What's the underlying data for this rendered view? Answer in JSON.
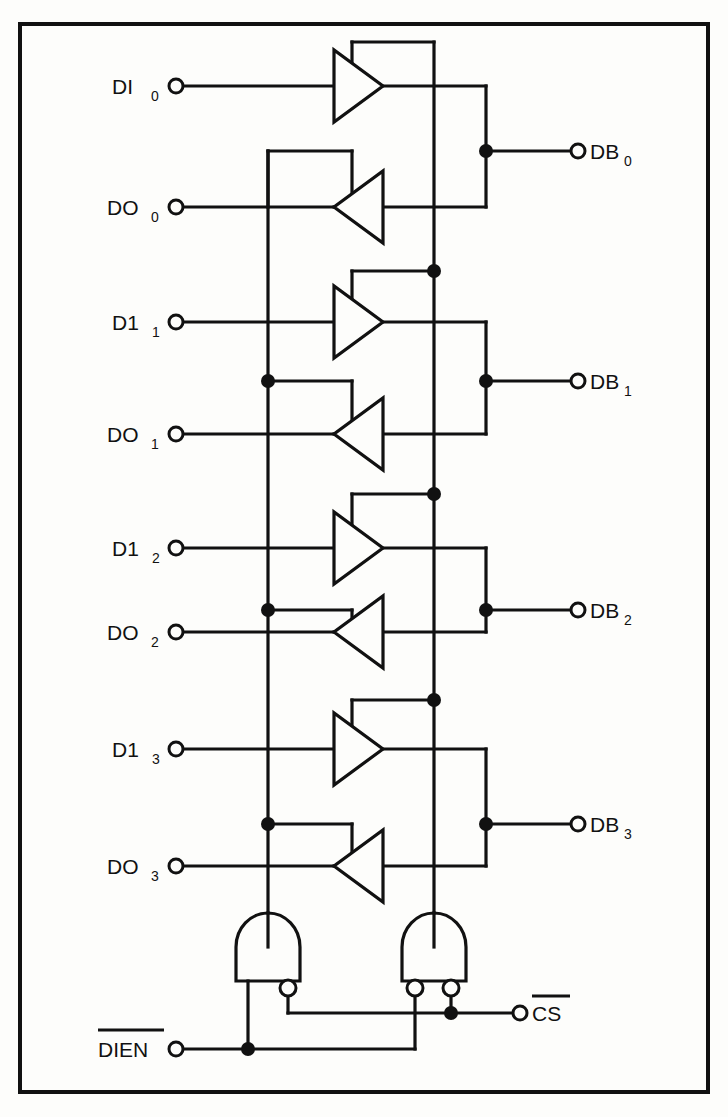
{
  "figure": {
    "kind": "logic-schematic",
    "background": "#fdfdfb",
    "ink": "#111111",
    "frame": {
      "x": 18,
      "y": 22,
      "width": 692,
      "height": 1072,
      "stroke_width": 4
    }
  },
  "channels": [
    {
      "index": 0,
      "in_label": "DI",
      "in_sub": "0",
      "out_label": "DO",
      "out_sub": "0",
      "bus_label": "DB",
      "bus_sub": "0"
    },
    {
      "index": 1,
      "in_label": "D1",
      "in_sub": "1",
      "out_label": "DO",
      "out_sub": "1",
      "bus_label": "DB",
      "bus_sub": "1"
    },
    {
      "index": 2,
      "in_label": "D1",
      "in_sub": "2",
      "out_label": "DO",
      "out_sub": "2",
      "bus_label": "DB",
      "bus_sub": "2"
    },
    {
      "index": 3,
      "in_label": "D1",
      "in_sub": "3",
      "out_label": "DO",
      "out_sub": "3",
      "bus_label": "DB",
      "bus_sub": "3"
    }
  ],
  "labels": {
    "di0": "DI",
    "di0_sub": "0",
    "do0": "DO",
    "do0_sub": "0",
    "db0": "DB",
    "db0_sub": "0",
    "di1": "D1",
    "di1_sub": "1",
    "do1": "DO",
    "do1_sub": "1",
    "db1": "DB",
    "db1_sub": "1",
    "di2": "D1",
    "di2_sub": "2",
    "do2": "DO",
    "do2_sub": "2",
    "db2": "DB",
    "db2_sub": "2",
    "di3": "D1",
    "di3_sub": "3",
    "do3": "DO",
    "do3_sub": "3",
    "db3": "DB",
    "db3_sub": "3",
    "dien": "DIEN",
    "cs": "CS"
  },
  "control": {
    "dien_label": "DIEN",
    "dien_active_low": true,
    "cs_label": "CS",
    "cs_active_low": true,
    "gates": [
      {
        "name": "write-enable-and-gate",
        "type": "AND",
        "inputs": [
          {
            "bubble": false,
            "source": "DIEN"
          },
          {
            "bubble": true,
            "source": "CS"
          }
        ],
        "drives": "left-bus"
      },
      {
        "name": "read-enable-and-gate",
        "type": "AND",
        "inputs": [
          {
            "bubble": true,
            "source": "DIEN"
          },
          {
            "bubble": true,
            "source": "CS"
          }
        ],
        "drives": "right-bus"
      }
    ]
  },
  "geometry": {
    "rows": [
      {
        "in_y": 86,
        "out_y": 207,
        "db_y": 151
      },
      {
        "in_y": 322,
        "out_y": 434,
        "db_y": 381
      },
      {
        "in_y": 548,
        "out_y": 632,
        "db_y": 610
      },
      {
        "in_y": 749,
        "out_y": 866,
        "db_y": 824
      }
    ],
    "pin_x_left": 176,
    "pin_x_right": 578,
    "bus_left_x": 268,
    "bus_right_x": 434,
    "db_stub_x": 486,
    "gate_left_x": 268,
    "gate_right_x": 434,
    "gate_top_y": 913,
    "gate_bottom_y": 981,
    "cs_rail_y": 1013,
    "dien_rail_y": 1049
  }
}
